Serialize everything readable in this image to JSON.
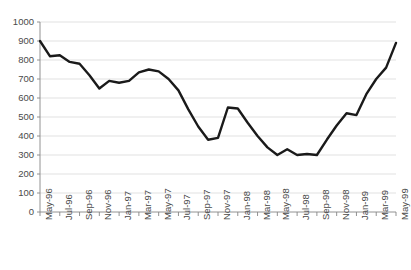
{
  "chart_data": {
    "type": "line",
    "title": "",
    "xlabel": "",
    "ylabel": "",
    "ylim": [
      0,
      1000
    ],
    "ytick_step": 100,
    "grid": true,
    "legend": false,
    "series_color": "#1a1a1a",
    "gridline_color": "#d9d9d9",
    "axis_color": "#868686",
    "tick_label_color": "#4a4a4a",
    "yticks": [
      0,
      100,
      200,
      300,
      400,
      500,
      600,
      700,
      800,
      900,
      1000
    ],
    "ytick_labels": [
      "0",
      "100",
      "200",
      "300",
      "400",
      "500",
      "600",
      "700",
      "800",
      "900",
      "1000"
    ],
    "x": [
      "May-96",
      "Jun-96",
      "Jul-96",
      "Aug-96",
      "Sep-96",
      "Oct-96",
      "Nov-96",
      "Dec-96",
      "Jan-97",
      "Feb-97",
      "Mar-97",
      "Apr-97",
      "May-97",
      "Jun-97",
      "Jul-97",
      "Aug-97",
      "Sep-97",
      "Oct-97",
      "Nov-97",
      "Dec-97",
      "Jan-98",
      "Feb-98",
      "Mar-98",
      "Apr-98",
      "May-98",
      "Jun-98",
      "Jul-98",
      "Aug-98",
      "Sep-98",
      "Oct-98",
      "Nov-98",
      "Dec-98",
      "Jan-99",
      "Feb-99",
      "Mar-99",
      "Apr-99",
      "May-99"
    ],
    "xtick_labels": [
      "May-96",
      "Jul-96",
      "Sep-96",
      "Nov-96",
      "Jan-97",
      "Mar-97",
      "May-97",
      "Jul-97",
      "Sep-97",
      "Nov-97",
      "Jan-98",
      "Mar-98",
      "May-98",
      "Jul-98",
      "Sep-98",
      "Nov-98",
      "Jan-99",
      "Mar-99",
      "May-99"
    ],
    "xtick_every": 2,
    "values": [
      900,
      820,
      825,
      790,
      780,
      720,
      650,
      690,
      680,
      690,
      735,
      750,
      740,
      700,
      640,
      540,
      450,
      380,
      390,
      550,
      545,
      470,
      400,
      340,
      300,
      330,
      300,
      305,
      300,
      380,
      455,
      520,
      510,
      620,
      700,
      760,
      890
    ]
  }
}
